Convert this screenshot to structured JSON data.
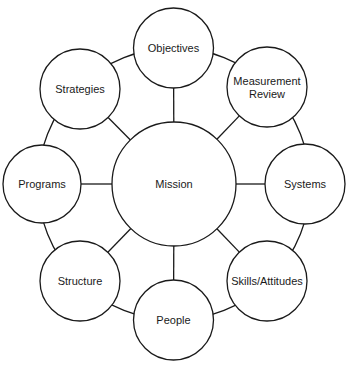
{
  "diagram": {
    "type": "hub-and-spoke",
    "center": {
      "id": "mission",
      "label": "Mission",
      "cx": 174,
      "cy": 184,
      "r": 62
    },
    "nodes": [
      {
        "id": "objectives",
        "label_lines": [
          "Objectives"
        ],
        "cx": 173.5,
        "cy": 48,
        "r": 40
      },
      {
        "id": "measurement-review",
        "label_lines": [
          "Measurement",
          "Review"
        ],
        "cx": 267,
        "cy": 87,
        "r": 40
      },
      {
        "id": "systems",
        "label_lines": [
          "Systems"
        ],
        "cx": 305,
        "cy": 184,
        "r": 40
      },
      {
        "id": "skills-attitudes",
        "label_lines": [
          "Skills/Attitudes"
        ],
        "cx": 267,
        "cy": 281,
        "r": 40
      },
      {
        "id": "people",
        "label_lines": [
          "People"
        ],
        "cx": 173.5,
        "cy": 320,
        "r": 40
      },
      {
        "id": "structure",
        "label_lines": [
          "Structure"
        ],
        "cx": 80,
        "cy": 281,
        "r": 40
      },
      {
        "id": "programs",
        "label_lines": [
          "Programs"
        ],
        "cx": 42,
        "cy": 184,
        "r": 39
      },
      {
        "id": "strategies",
        "label_lines": [
          "Strategies"
        ],
        "cx": 80,
        "cy": 89,
        "r": 40
      }
    ],
    "ring_radius": 136
  }
}
